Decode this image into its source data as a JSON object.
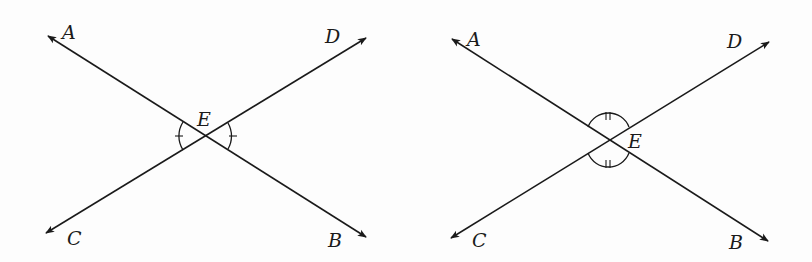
{
  "figures": [
    {
      "id": "left",
      "description": "Two intersecting lines AB and CD meeting at E; vertical angles AEC and DEB marked congruent with single tick marks",
      "labels": {
        "A": "A",
        "B": "B",
        "C": "C",
        "D": "D",
        "E": "E"
      },
      "marked_angles": [
        "AEC",
        "DEB"
      ],
      "tick_marks": 1
    },
    {
      "id": "right",
      "description": "Two intersecting lines AB and CD meeting at E; vertical angles AED and CEB marked congruent with double tick marks",
      "labels": {
        "A": "A",
        "B": "B",
        "C": "C",
        "D": "D",
        "E": "E"
      },
      "marked_angles": [
        "AED",
        "CEB"
      ],
      "tick_marks": 2
    }
  ]
}
